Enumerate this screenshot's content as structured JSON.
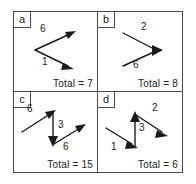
{
  "figure": {
    "title_visible": false,
    "line_color": "#1a1a1a",
    "border_color": "#4a4a4a",
    "background": "#ffffff",
    "panels": [
      {
        "tag": "a",
        "total_label": "Total = 7",
        "arrows": [
          {
            "label": "6",
            "direction": "up-right",
            "label_x": 26,
            "label_y": 15
          },
          {
            "label": "1",
            "direction": "down-right",
            "label_x": 28,
            "label_y": 45
          }
        ]
      },
      {
        "tag": "b",
        "total_label": "Total = 8",
        "arrows": [
          {
            "label": "2",
            "direction": "down-right",
            "label_x": 43,
            "label_y": 13
          },
          {
            "label": "6",
            "direction": "up-right",
            "label_x": 35,
            "label_y": 48
          }
        ]
      },
      {
        "tag": "c",
        "total_label": "Total = 15",
        "arrows": [
          {
            "label": "6",
            "direction": "up-right",
            "label_x": 14,
            "label_y": 15
          },
          {
            "label": "3",
            "direction": "down",
            "label_x": 44,
            "label_y": 31
          },
          {
            "label": "6",
            "direction": "up-right",
            "label_x": 49,
            "label_y": 52
          }
        ]
      },
      {
        "tag": "d",
        "total_label": "Total = 6",
        "arrows": [
          {
            "label": "1",
            "direction": "up-right",
            "label_x": 13,
            "label_y": 53
          },
          {
            "label": "3",
            "direction": "up",
            "label_x": 41,
            "label_y": 33
          },
          {
            "label": "2",
            "direction": "down-right",
            "label_x": 54,
            "label_y": 14
          }
        ]
      }
    ]
  }
}
